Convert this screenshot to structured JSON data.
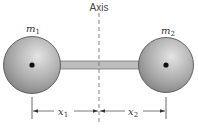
{
  "diagram": {
    "axis_label": "Axis",
    "mass1": {
      "label": "m",
      "sub": "1"
    },
    "mass2": {
      "label": "m",
      "sub": "2"
    },
    "dist1": {
      "label": "x",
      "sub": "1"
    },
    "dist2": {
      "label": "x",
      "sub": "2"
    },
    "colors": {
      "sphere": "#a8a8a8",
      "rod": "#b8b8b8",
      "line": "#555555"
    }
  }
}
